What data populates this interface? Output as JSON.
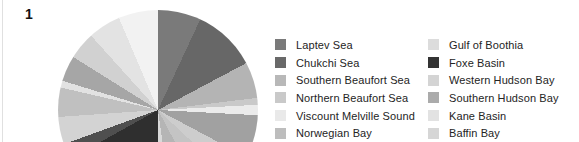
{
  "figure_label": "1",
  "background_color": "#ffffff",
  "chart_data": {
    "type": "pie",
    "title": "",
    "legend_position": "right",
    "legend_columns": 2,
    "legend": [
      {
        "label": "Laptev Sea",
        "color": "#7a7a7a"
      },
      {
        "label": "Chukchi Sea",
        "color": "#696969"
      },
      {
        "label": "Southern Beaufort Sea",
        "color": "#b8b8b8"
      },
      {
        "label": "Northern Beaufort Sea",
        "color": "#c9c9c9"
      },
      {
        "label": "Viscount Melville Sound",
        "color": "#e9e9e9"
      },
      {
        "label": "Norwegian Bay",
        "color": "#bdbdbd"
      },
      {
        "label": "Gulf of Boothia",
        "color": "#dcdcdc"
      },
      {
        "label": "Foxe Basin",
        "color": "#333333"
      },
      {
        "label": "Western Hudson Bay",
        "color": "#d4d4d4"
      },
      {
        "label": "Southern Hudson Bay",
        "color": "#ababab"
      },
      {
        "label": "Kane Basin",
        "color": "#e2e2e2"
      },
      {
        "label": "Baffin Bay",
        "color": "#d6d6d6"
      }
    ],
    "segments_clockwise_deg": [
      {
        "start": 0,
        "end": 25,
        "color": "#7a7a7a"
      },
      {
        "start": 25,
        "end": 62,
        "color": "#676767"
      },
      {
        "start": 62,
        "end": 83,
        "color": "#b4b4b4"
      },
      {
        "start": 83,
        "end": 87,
        "color": "#c9c9c9"
      },
      {
        "start": 87,
        "end": 93,
        "color": "#ebebeb"
      },
      {
        "start": 93,
        "end": 118,
        "color": "#a1a1a1"
      },
      {
        "start": 118,
        "end": 133,
        "color": "#cdcdcd"
      },
      {
        "start": 133,
        "end": 152,
        "color": "#c4c4c4"
      },
      {
        "start": 152,
        "end": 172,
        "color": "#b5b5b5"
      },
      {
        "start": 172,
        "end": 180,
        "color": "#d9d9d9"
      },
      {
        "start": 180,
        "end": 241,
        "color": "#2f2f2f"
      },
      {
        "start": 241,
        "end": 250,
        "color": "#4f4f4f"
      },
      {
        "start": 250,
        "end": 266,
        "color": "#d3d3d3"
      },
      {
        "start": 266,
        "end": 283,
        "color": "#c0c0c0"
      },
      {
        "start": 283,
        "end": 287,
        "color": "#e2e2e2"
      },
      {
        "start": 287,
        "end": 302,
        "color": "#a6a6a6"
      },
      {
        "start": 302,
        "end": 318,
        "color": "#d1d1d1"
      },
      {
        "start": 318,
        "end": 337,
        "color": "#e3e3e3"
      },
      {
        "start": 337,
        "end": 360,
        "color": "#f2f2f2"
      }
    ]
  }
}
